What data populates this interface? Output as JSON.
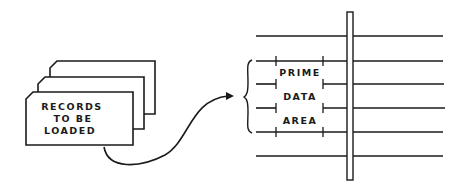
{
  "diagram": {
    "records": {
      "lines": [
        "RECORDS",
        "TO BE",
        "LOADED"
      ],
      "card_count": 3
    },
    "prime_area": {
      "labels": [
        "PRIME",
        "DATA",
        "AREA"
      ]
    },
    "track_lines": 6,
    "colors": {
      "ink": "#1a1a1a",
      "background": "#ffffff"
    }
  }
}
